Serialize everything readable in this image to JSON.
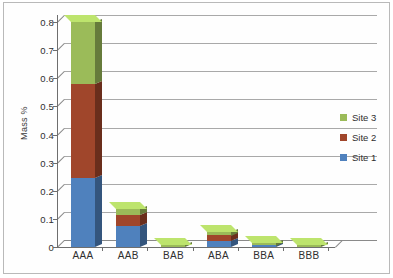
{
  "chart_data": {
    "type": "bar",
    "subtype": "stacked-column-3d",
    "title": "",
    "xlabel": "",
    "ylabel": "Mass %",
    "categories": [
      "AAA",
      "AAB",
      "BAB",
      "ABA",
      "BBA",
      "BBB"
    ],
    "series": [
      {
        "name": "Site 1",
        "color": "#4F81BD",
        "values": [
          0.245,
          0.075,
          0.0,
          0.022,
          0.006,
          0.0
        ]
      },
      {
        "name": "Site 2",
        "color": "#A0462B",
        "values": [
          0.335,
          0.04,
          0.0,
          0.02,
          0.0,
          0.0
        ]
      },
      {
        "name": "Site 3",
        "color": "#9BBB59",
        "values": [
          0.22,
          0.02,
          0.006,
          0.013,
          0.01,
          0.006
        ]
      }
    ],
    "totals": [
      0.8,
      0.135,
      0.006,
      0.055,
      0.016,
      0.006
    ],
    "ylim": [
      0,
      0.8
    ],
    "ytick_values": [
      0,
      0.1,
      0.2,
      0.3,
      0.4,
      0.5,
      0.6,
      0.7,
      0.8
    ],
    "ytick_labels": [
      "0",
      "0.1",
      "0.2",
      "0.3",
      "0.4",
      "0.5",
      "0.6",
      "0.7",
      "0.8"
    ],
    "grid": true,
    "legend_position": "right",
    "legend_order": [
      "Site 3",
      "Site 2",
      "Site 1"
    ]
  },
  "legend": {
    "entries": [
      {
        "label": "Site 3",
        "color": "#9BBB59"
      },
      {
        "label": "Site 2",
        "color": "#A0462B"
      },
      {
        "label": "Site 1",
        "color": "#4F81BD"
      }
    ]
  },
  "colors": {
    "site1": "#4F81BD",
    "site2": "#A0462B",
    "site3": "#9BBB59",
    "gridline": "#9a9a9a",
    "axis": "#6e6e6e",
    "frame": "#b9b9b9",
    "background": "#ffffff"
  }
}
